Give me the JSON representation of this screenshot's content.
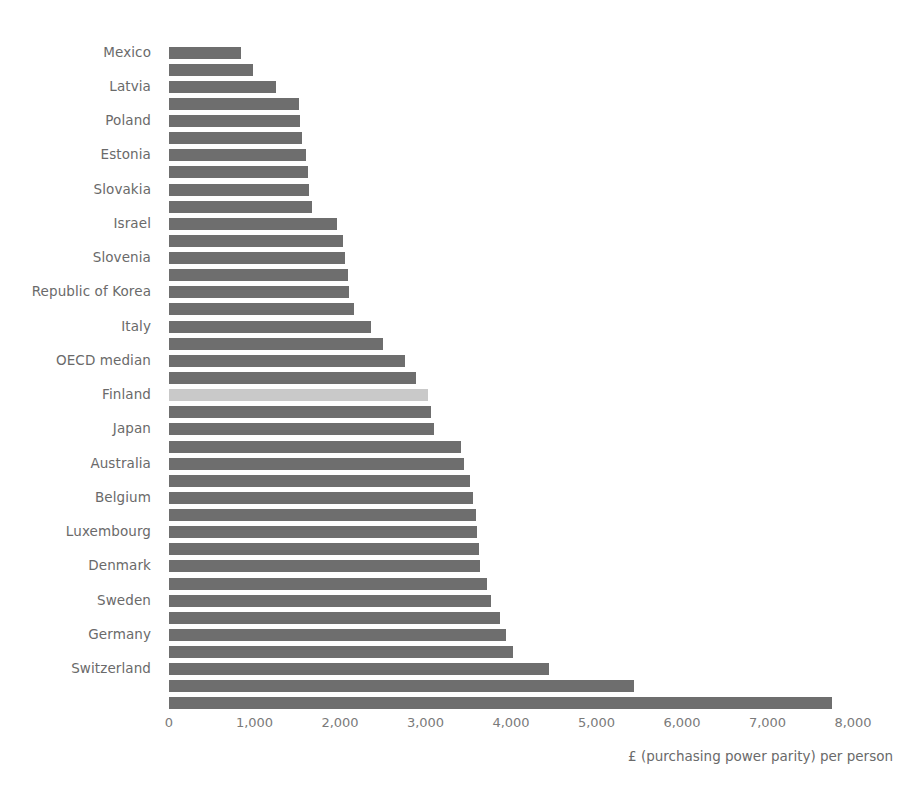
{
  "chart_data": {
    "type": "bar",
    "orientation": "horizontal",
    "title": "",
    "subtitle": "",
    "xlabel": "£ (purchasing power parity) per person",
    "ylabel": "",
    "xlim": [
      0,
      8000
    ],
    "xticks": [
      "0",
      "1,000",
      "2,000",
      "3,000",
      "4,000",
      "5,000",
      "6,000",
      "7,000",
      "8,000"
    ],
    "xtick_values": [
      0,
      1000,
      2000,
      3000,
      4000,
      5000,
      6000,
      7000,
      8000
    ],
    "grid": false,
    "legend": false,
    "bar_color": "#6e6e6e",
    "highlight_color": "#c9c9c9",
    "visible_label_interval": 2,
    "categories": [
      "Mexico",
      "",
      "Latvia",
      "",
      "Poland",
      "",
      "Estonia",
      "",
      "Slovakia",
      "",
      "Israel",
      "",
      "Slovenia",
      "",
      "Republic of Korea",
      "",
      "Italy",
      "",
      "OECD median",
      "",
      "Finland",
      "",
      "Japan",
      "",
      "Australia",
      "",
      "Belgium",
      "",
      "Luxembourg",
      "",
      "Denmark",
      "",
      "Sweden",
      "",
      "Germany",
      "",
      "Switzerland",
      "",
      ""
    ],
    "values": [
      840,
      980,
      1250,
      1520,
      1530,
      1560,
      1600,
      1620,
      1640,
      1670,
      1960,
      2030,
      2060,
      2090,
      2100,
      2160,
      2360,
      2500,
      2760,
      2890,
      3030,
      3060,
      3100,
      3420,
      3450,
      3520,
      3560,
      3590,
      3600,
      3620,
      3640,
      3720,
      3770,
      3870,
      3940,
      4020,
      4440,
      5440,
      7760
    ],
    "highlight_index": 20,
    "highlight_label": "OECD median",
    "bar_count": 39
  }
}
